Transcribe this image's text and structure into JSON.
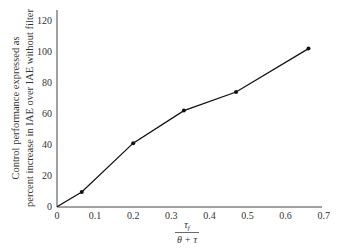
{
  "chart_data": {
    "type": "line",
    "title": "",
    "xlabel": "τ_f / (θ + τ)",
    "xlabel_parts": {
      "numerator": "τ",
      "numerator_sub": "f",
      "denominator": "θ + τ"
    },
    "ylabel": "Control performance expressed as percent increase in IAE over IAE without filter",
    "ylabel_lines": [
      "Control performance expressed as",
      "percent increase in IAE over IAE without filter"
    ],
    "xlim": [
      0,
      0.7
    ],
    "ylim": [
      0,
      120
    ],
    "x_ticks": [
      "0",
      "0.1",
      "0.2",
      "0.3",
      "0.4",
      "0.5",
      "0.6",
      "0.7"
    ],
    "y_ticks": [
      "0",
      "20",
      "40",
      "60",
      "80",
      "100",
      "120"
    ],
    "grid": false,
    "legend": null,
    "series": [
      {
        "name": "IAE increase",
        "color": "#111111",
        "markers": true,
        "points": [
          {
            "x": 0,
            "y": 0,
            "marker": false
          },
          {
            "x": 0.065,
            "y": 9.5,
            "marker": true
          },
          {
            "x": 0.2,
            "y": 41,
            "marker": true
          },
          {
            "x": 0.333,
            "y": 62,
            "marker": true
          },
          {
            "x": 0.47,
            "y": 74,
            "marker": true
          },
          {
            "x": 0.66,
            "y": 102,
            "marker": true
          }
        ]
      }
    ]
  }
}
